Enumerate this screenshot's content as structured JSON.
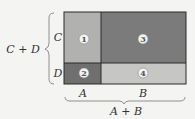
{
  "diagram": {
    "colors": {
      "region1": "#b1b1b0",
      "region2": "#6f6f6f",
      "region3": "#7b7b7b",
      "region4": "#c6c6c5",
      "border": "#2a2a2a",
      "background": "#f4f4f2"
    },
    "regions": [
      {
        "id": 1,
        "label": "1",
        "row": "C",
        "col": "A"
      },
      {
        "id": 2,
        "label": "2",
        "row": "D",
        "col": "A"
      },
      {
        "id": 3,
        "label": "3",
        "row": "C",
        "col": "B"
      },
      {
        "id": 4,
        "label": "4",
        "row": "D",
        "col": "B"
      }
    ],
    "row_labels": {
      "top": "C",
      "bottom": "D"
    },
    "col_labels": {
      "left": "A",
      "right": "B"
    },
    "vertical_brace_label": "C + D",
    "horizontal_brace_label": "A + B"
  }
}
